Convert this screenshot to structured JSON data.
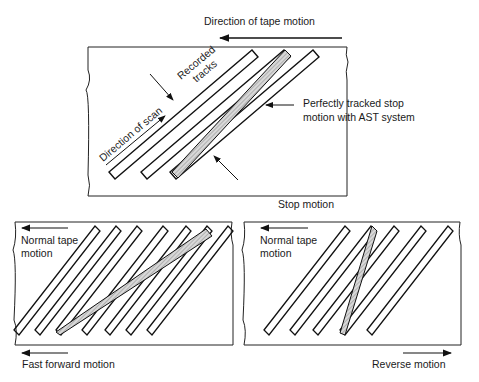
{
  "diagram": {
    "type": "helical-scan-track-diagram",
    "panels": [
      {
        "id": "stop",
        "caption": "Stop motion",
        "labels": {
          "tape_motion": "Direction of tape motion",
          "tracks": [
            "Recorded",
            "tracks"
          ],
          "scan": "Direction of scan",
          "ast": [
            "Perfectly tracked stop",
            "motion with AST system"
          ]
        }
      },
      {
        "id": "fast-forward",
        "caption": "Fast forward motion",
        "labels": {
          "tape": [
            "Normal tape",
            "motion"
          ]
        }
      },
      {
        "id": "reverse",
        "caption": "Reverse motion",
        "labels": {
          "tape": [
            "Normal tape",
            "motion"
          ]
        }
      }
    ]
  }
}
